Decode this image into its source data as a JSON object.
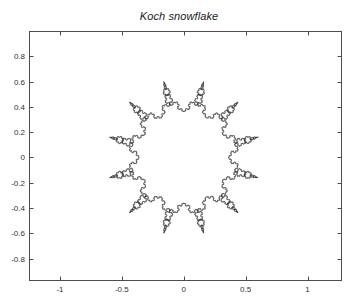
{
  "figure": {
    "background_color": "#ffffff",
    "title": "Koch snowflake"
  },
  "axes": {
    "box_color": "#4d4d4d",
    "tick_direction": "in",
    "grid": false,
    "xlim": [
      -1.25,
      1.27
    ],
    "ylim": [
      -0.97,
      1.0
    ],
    "pixel_box": {
      "left": 29,
      "top": 31,
      "right": 341,
      "bottom": 280
    },
    "x_ticks": [
      {
        "value": -1,
        "label": "-1"
      },
      {
        "value": -0.5,
        "label": "-0.5"
      },
      {
        "value": 0,
        "label": "0"
      },
      {
        "value": 0.5,
        "label": "0.5"
      },
      {
        "value": 1,
        "label": "1"
      }
    ],
    "y_ticks": [
      {
        "value": 0.8,
        "label": "0.8"
      },
      {
        "value": 0.6,
        "label": "0.6"
      },
      {
        "value": 0.4,
        "label": "0.4"
      },
      {
        "value": 0.2,
        "label": "0.2"
      },
      {
        "value": 0,
        "label": "0"
      },
      {
        "value": -0.2,
        "label": "-0.2"
      },
      {
        "value": -0.4,
        "label": "-0.4"
      },
      {
        "value": -0.6,
        "label": "-0.6"
      },
      {
        "value": -0.8,
        "label": "-0.8"
      }
    ]
  },
  "chart_data": {
    "type": "line",
    "title": "Koch snowflake",
    "xlabel": "",
    "ylabel": "",
    "xlim": [
      -1.25,
      1.27
    ],
    "ylim": [
      -0.97,
      1.0
    ],
    "grid": false,
    "legend": null,
    "series": [
      {
        "name": "Koch snowflake",
        "color": "#333333",
        "line_width": 0.6,
        "closed": true,
        "fill": "none",
        "description": "Closed Koch-type fractal curve forming a 12-lobed snowflake outline centered near the origin",
        "generator": {
          "base_polygon_sides": 12,
          "base_radius": 0.62,
          "alternating_radius_ratio": 0.58,
          "koch_iterations": 5,
          "koch_bump_height_ratio": 0.2886751345948129,
          "bump_outward": true,
          "rotation_deg": 15
        },
        "extent": {
          "x_min": -0.92,
          "x_max": 0.98,
          "y_min": -0.9,
          "y_max": 0.95
        }
      }
    ]
  }
}
